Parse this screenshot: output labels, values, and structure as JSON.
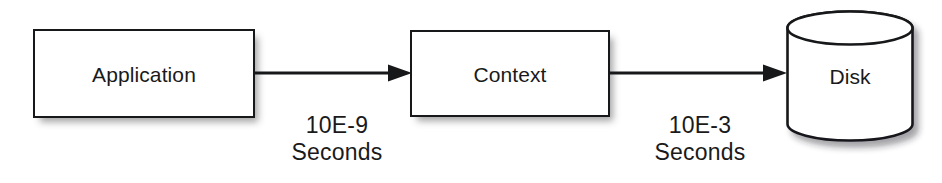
{
  "diagram": {
    "background_color": "#ffffff",
    "stroke_color": "#17181a",
    "text_color": "#1a1a1a",
    "nodes": [
      {
        "id": "application",
        "label": "Application",
        "shape": "rectangle"
      },
      {
        "id": "context",
        "label": "Context",
        "shape": "rectangle"
      },
      {
        "id": "disk",
        "label": "Disk",
        "shape": "cylinder"
      }
    ],
    "edges": [
      {
        "id": "app-to-context",
        "from": "application",
        "to": "context",
        "direction": "right",
        "caption_value": "10E-9",
        "caption_unit": "Seconds"
      },
      {
        "id": "context-to-disk",
        "from": "context",
        "to": "disk",
        "direction": "right",
        "caption_value": "10E-3",
        "caption_unit": "Seconds"
      }
    ]
  }
}
